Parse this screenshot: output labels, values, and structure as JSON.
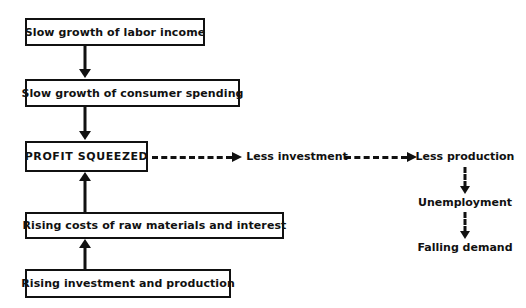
{
  "diagram": {
    "colors": {
      "stroke": "#111111",
      "background": "#ffffff",
      "text": "#111111"
    },
    "boxes": [
      {
        "id": "labor-income",
        "label": "Slow growth of labor income"
      },
      {
        "id": "consumer-spending",
        "label": "Slow growth of consumer spending"
      },
      {
        "id": "profit-squeezed",
        "label": "PROFIT SQUEEZED"
      },
      {
        "id": "rising-costs",
        "label": "Rising costs of raw materials and interest"
      },
      {
        "id": "rising-investment",
        "label": "Rising investment and production"
      }
    ],
    "text_nodes": [
      {
        "id": "less-investment",
        "label": "Less investment"
      },
      {
        "id": "less-production",
        "label": "Less production"
      },
      {
        "id": "unemployment",
        "label": "Unemployment"
      },
      {
        "id": "falling-demand",
        "label": "Falling demand"
      }
    ],
    "edges": [
      {
        "id": "e1",
        "from": "labor-income",
        "to": "consumer-spending",
        "style": "solid",
        "direction": "down"
      },
      {
        "id": "e2",
        "from": "consumer-spending",
        "to": "profit-squeezed",
        "style": "solid",
        "direction": "down"
      },
      {
        "id": "e3",
        "from": "rising-costs",
        "to": "profit-squeezed",
        "style": "solid",
        "direction": "up"
      },
      {
        "id": "e4",
        "from": "rising-investment",
        "to": "rising-costs",
        "style": "solid",
        "direction": "up"
      },
      {
        "id": "e5",
        "from": "profit-squeezed",
        "to": "less-investment",
        "style": "dashed",
        "direction": "right"
      },
      {
        "id": "e6",
        "from": "less-investment",
        "to": "less-production",
        "style": "dashed",
        "direction": "right"
      },
      {
        "id": "e7",
        "from": "less-production",
        "to": "unemployment",
        "style": "dashed",
        "direction": "down"
      },
      {
        "id": "e8",
        "from": "unemployment",
        "to": "falling-demand",
        "style": "dashed",
        "direction": "down"
      }
    ]
  }
}
